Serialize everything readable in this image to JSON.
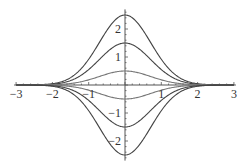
{
  "chart_data": {
    "type": "line",
    "title": "",
    "xlabel": "",
    "ylabel": "",
    "xlim": [
      -3,
      3
    ],
    "ylim": [
      -2.7,
      2.7
    ],
    "grid": false,
    "legend": null,
    "x_ticks": [
      -3,
      -2,
      -1,
      1,
      2,
      3
    ],
    "x_tick_labels": [
      "-3",
      "-2",
      "-1",
      "1",
      "2",
      "3"
    ],
    "y_ticks": [
      -2,
      -1,
      1,
      2
    ],
    "y_tick_labels": [
      "-2",
      "-1",
      "1",
      "2"
    ],
    "function_form": "a * exp(-x^2) (approximate bell-shaped curves)",
    "series": [
      {
        "name": "a=2.5",
        "amplitude": 2.5
      },
      {
        "name": "a=1.5",
        "amplitude": 1.5
      },
      {
        "name": "a=0.5",
        "amplitude": 0.5
      },
      {
        "name": "a=-0.5",
        "amplitude": -0.5
      },
      {
        "name": "a=-1.5",
        "amplitude": -1.5
      },
      {
        "name": "a=-2.5",
        "amplitude": -2.5
      }
    ],
    "colors": {
      "axis": "#555555",
      "curve": "#444444",
      "curve_light": "#777777"
    }
  }
}
